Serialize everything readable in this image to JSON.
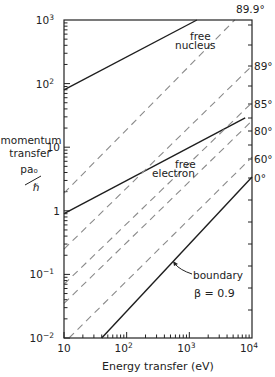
{
  "chart_data": {
    "type": "line",
    "title": "",
    "xlabel": "Energy transfer (eV)",
    "ylabel_lines": [
      "momentum",
      "transfer"
    ],
    "ylabel_units_num": "pa₀",
    "ylabel_units_den": "ℏ",
    "x_scale": "log",
    "y_scale": "log",
    "xlim": [
      10,
      10000
    ],
    "ylim": [
      0.01,
      1000
    ],
    "grid": false,
    "x_ticks": [
      {
        "value": 10,
        "label": "10"
      },
      {
        "value": 100,
        "label": "10",
        "sup": "2"
      },
      {
        "value": 1000,
        "label": "10",
        "sup": "3"
      },
      {
        "value": 10000,
        "label": "10",
        "sup": "4"
      }
    ],
    "y_ticks": [
      {
        "value": 0.01,
        "label": "10",
        "sup": "−2"
      },
      {
        "value": 0.1,
        "label": "10",
        "sup": "−1"
      },
      {
        "value": 1,
        "label": "1"
      },
      {
        "value": 10,
        "label": "10"
      },
      {
        "value": 100,
        "label": "10",
        "sup": "2"
      },
      {
        "value": 1000,
        "label": "10",
        "sup": "3"
      }
    ],
    "series": [
      {
        "name": "free nucleus",
        "style": "solid",
        "label_lines": [
          "free",
          "nucleus"
        ],
        "x": [
          10,
          1320
        ],
        "y": [
          80,
          1000
        ]
      },
      {
        "name": "free electron",
        "style": "solid",
        "label_lines": [
          "free",
          "electron"
        ],
        "x": [
          10,
          7800
        ],
        "y": [
          0.9,
          29
        ]
      },
      {
        "name": "boundary β = 0.9",
        "style": "solid",
        "label_lines": [
          "boundary",
          "β = 0.9"
        ],
        "x": [
          40,
          10000
        ],
        "y": [
          0.01,
          3.4
        ]
      },
      {
        "name": "89.9°",
        "style": "dashed",
        "x": [
          10,
          5300
        ],
        "y": [
          1.9,
          1000
        ]
      },
      {
        "name": "89°",
        "style": "dashed",
        "x": [
          10,
          10000
        ],
        "y": [
          0.25,
          190
        ]
      },
      {
        "name": "85°",
        "style": "dashed",
        "x": [
          10,
          10000
        ],
        "y": [
          0.07,
          50
        ]
      },
      {
        "name": "80°",
        "style": "dashed",
        "x": [
          10,
          10000
        ],
        "y": [
          0.035,
          26
        ]
      },
      {
        "name": "60°",
        "style": "dashed",
        "x": [
          12,
          10000
        ],
        "y": [
          0.01,
          7
        ]
      }
    ],
    "angle_labels": [
      {
        "text": "89.9°",
        "y_px": 9
      },
      {
        "text": "89°",
        "y_px": 66
      },
      {
        "text": "85°",
        "y_px": 104
      },
      {
        "text": "80°",
        "y_px": 131
      },
      {
        "text": "60°",
        "y_px": 159
      },
      {
        "text": "0°",
        "y_px": 178
      }
    ],
    "legend": "none (inline annotations)"
  }
}
